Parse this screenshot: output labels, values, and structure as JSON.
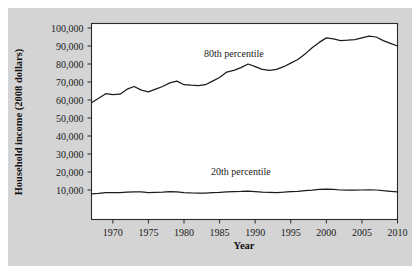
{
  "figure": {
    "background_color": "#ffffff",
    "panel_color": "#d4d4d4",
    "plot_background_color": "#ffffff",
    "line_color": "#1c1c1c"
  },
  "axis_titles": {
    "y": "Household income (2008 dollars)",
    "x": "Year"
  },
  "annotations": {
    "series_80": "80th percentile",
    "series_20": "20th percentile"
  },
  "ticks": {
    "y_labels": [
      "100,000",
      "90,000",
      "80,000",
      "70,000",
      "60,000",
      "50,000",
      "40,000",
      "30,000",
      "20,000",
      "10,000"
    ],
    "x_labels": [
      "1970",
      "1975",
      "1980",
      "1985",
      "1990",
      "1995",
      "2000",
      "2005",
      "2010"
    ]
  },
  "chart_data": {
    "type": "line",
    "title": "",
    "xlabel": "Year",
    "ylabel": "Household income (2008 dollars)",
    "xlim": [
      1967,
      2010
    ],
    "ylim": [
      0,
      105000
    ],
    "xticks": [
      1970,
      1975,
      1980,
      1985,
      1990,
      1995,
      2000,
      2005,
      2010
    ],
    "yticks": [
      10000,
      20000,
      30000,
      40000,
      50000,
      60000,
      70000,
      80000,
      90000,
      100000
    ],
    "grid": false,
    "legend": "inline-annotations",
    "x": [
      1967,
      1968,
      1969,
      1970,
      1971,
      1972,
      1973,
      1974,
      1975,
      1976,
      1977,
      1978,
      1979,
      1980,
      1981,
      1982,
      1983,
      1984,
      1985,
      1986,
      1987,
      1988,
      1989,
      1990,
      1991,
      1992,
      1993,
      1994,
      1995,
      1996,
      1997,
      1998,
      1999,
      2000,
      2001,
      2002,
      2003,
      2004,
      2005,
      2006,
      2007,
      2008,
      2009,
      2010
    ],
    "series": [
      {
        "name": "80th percentile",
        "label_position": {
          "x": 1987,
          "y": 84000
        },
        "values": [
          58500,
          61000,
          63500,
          63000,
          63200,
          66000,
          67500,
          65500,
          64500,
          66000,
          67500,
          69500,
          70500,
          68500,
          68200,
          68000,
          68500,
          70500,
          72500,
          75500,
          76500,
          78000,
          80000,
          78500,
          77000,
          76500,
          77000,
          78500,
          80500,
          82500,
          85500,
          89000,
          92000,
          94500,
          94000,
          93000,
          93200,
          93500,
          94500,
          95500,
          95000,
          93000,
          91500,
          90000
        ]
      },
      {
        "name": "20th percentile",
        "label_position": {
          "x": 1988,
          "y": 18500
        },
        "values": [
          7800,
          8100,
          8500,
          8600,
          8500,
          8800,
          9000,
          8900,
          8600,
          8700,
          8800,
          9100,
          9000,
          8600,
          8400,
          8300,
          8300,
          8500,
          8700,
          9000,
          9100,
          9200,
          9400,
          9100,
          8800,
          8700,
          8600,
          8800,
          9100,
          9300,
          9600,
          9900,
          10300,
          10500,
          10300,
          10000,
          9900,
          9900,
          10000,
          10100,
          10000,
          9600,
          9300,
          9000
        ]
      }
    ]
  }
}
